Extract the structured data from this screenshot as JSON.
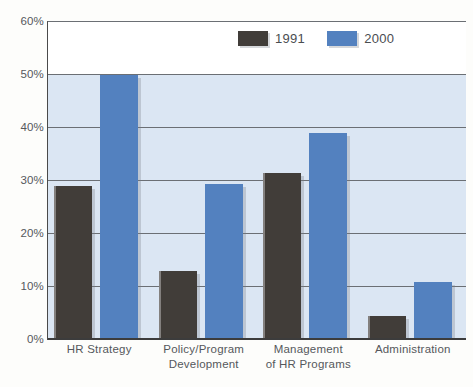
{
  "chart_data": {
    "type": "bar",
    "title": "",
    "subtitle": "",
    "xlabel": "",
    "ylabel": "",
    "ylim": [
      0,
      60
    ],
    "y_ticks": [
      "0%",
      "10%",
      "20%",
      "30%",
      "40%",
      "50%",
      "60%"
    ],
    "y_tick_values": [
      0,
      10,
      20,
      30,
      40,
      50,
      60
    ],
    "grid": true,
    "legend_position": "top-center",
    "categories": [
      "HR Strategy",
      "Policy/Program Development",
      "Management of HR Programs",
      "Administration"
    ],
    "category_lines": [
      [
        "HR Strategy"
      ],
      [
        "Policy/Program",
        "Development"
      ],
      [
        "Management",
        "of HR Programs"
      ],
      [
        "Administration"
      ]
    ],
    "series": [
      {
        "name": "1991",
        "color": "#413d39",
        "values": [
          29,
          13,
          31.5,
          4.5
        ]
      },
      {
        "name": "2000",
        "color": "#5381bf",
        "values": [
          50,
          29.5,
          39,
          11
        ]
      }
    ]
  },
  "legend": {
    "items": [
      {
        "label": "1991"
      },
      {
        "label": "2000"
      }
    ]
  },
  "colors": {
    "series_1991": "#413d39",
    "series_2000": "#5381bf",
    "plot_background_upper": "#ffffff",
    "plot_background_lower": "#dbe6f3",
    "gridline": "#6b6f74",
    "axis": "#3c3c3c",
    "text": "#55585c",
    "page_background": "#fdfdfb"
  }
}
